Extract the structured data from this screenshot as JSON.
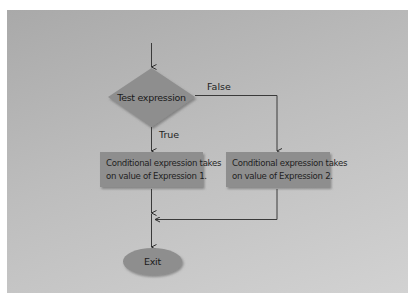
{
  "diagram": {
    "type": "flowchart",
    "start_arrow": true,
    "decision": {
      "label": "Test expression"
    },
    "branches": {
      "true_label": "True",
      "false_label": "False"
    },
    "process_true": {
      "line1": "Conditional expression takes",
      "line2": "on value of Expression 1."
    },
    "process_false": {
      "line1": "Conditional expression takes",
      "line2": "on value of Expression 2."
    },
    "terminal": {
      "label": "Exit"
    },
    "colors": {
      "background": "#bdbdbd",
      "shape_fill": "#8c8c8c",
      "line": "#3a3a3a",
      "text": "#1e1e1e"
    }
  }
}
